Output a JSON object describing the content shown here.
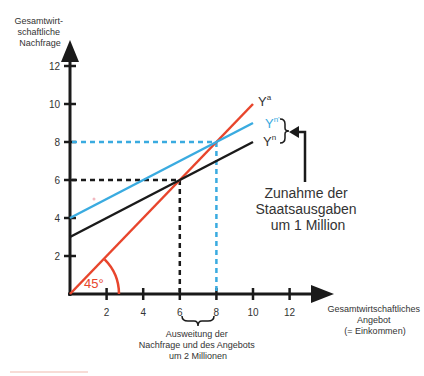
{
  "chart_data": {
    "type": "line",
    "title": "",
    "ylabel": [
      "Gesamtwirt-",
      "schaftliche",
      "Nachfrage"
    ],
    "xlabel": [
      "Gesamtwirtschaftliches",
      "Angebot",
      "(= Einkommen)"
    ],
    "xlim": [
      0,
      12
    ],
    "ylim": [
      0,
      12
    ],
    "x_ticks": [
      2,
      4,
      6,
      8,
      10,
      12
    ],
    "y_ticks": [
      2,
      4,
      6,
      8,
      10,
      12
    ],
    "x_tick_labels": [
      "2",
      "4",
      "6",
      "8",
      "10",
      "12"
    ],
    "y_tick_labels": [
      "2",
      "4",
      "6",
      "8",
      "10",
      "12"
    ],
    "grid": false,
    "series": [
      {
        "name": "Ya",
        "label_main": "Y",
        "label_sup": "a",
        "color": "#e8452c",
        "x": [
          0,
          10
        ],
        "y": [
          0,
          10
        ]
      },
      {
        "name": "Yn'",
        "label_main": "Y",
        "label_sup": "n'",
        "color": "#3aabe0",
        "x": [
          0,
          10
        ],
        "y": [
          4,
          9
        ]
      },
      {
        "name": "Yn",
        "label_main": "Y",
        "label_sup": "n",
        "color": "#1a1a1a",
        "x": [
          0,
          10
        ],
        "y": [
          3,
          8
        ]
      }
    ],
    "guides": [
      {
        "name": "equilibrium-initial",
        "x": 6,
        "y": 6,
        "color": "#1a1a1a"
      },
      {
        "name": "equilibrium-new",
        "x": 8,
        "y": 8,
        "color": "#3aabe0"
      }
    ],
    "annotations": {
      "angle": "45°",
      "shift": [
        "Zunahme der",
        "Staatsausgaben",
        "um 1 Million"
      ],
      "expansion": [
        "Ausweitung der",
        "Nachfrage und des Angebots",
        "um 2 Millionen"
      ]
    }
  }
}
